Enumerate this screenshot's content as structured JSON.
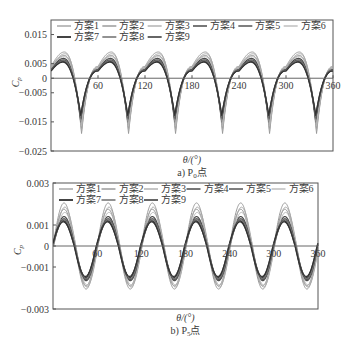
{
  "figure": {
    "background": "#ffffff",
    "axis_color": "#555555",
    "zero_line_color": "#666666"
  },
  "chart_data": [
    {
      "id": "P0",
      "type": "line",
      "title": "",
      "caption": "a) P₀点",
      "caption_prefix": "a) P",
      "caption_sub": "0",
      "caption_suffix": "点",
      "xlabel": "θ/(°)",
      "ylabel": "Cp",
      "ylabel_main": "C",
      "ylabel_sub": "p",
      "xlim": [
        0,
        360
      ],
      "ylim": [
        -0.025,
        0.02
      ],
      "xticks": [
        60,
        120,
        180,
        240,
        300,
        360
      ],
      "xtick_labels": [
        "60",
        "120",
        "180",
        "240",
        "300",
        "360"
      ],
      "yticks": [
        0.015,
        0.005,
        0,
        -0.005,
        -0.015,
        -0.025
      ],
      "ytick_labels": [
        "0.015",
        "0.005",
        "0",
        "-0.005",
        "-0.015",
        "-0.025"
      ],
      "grid": false,
      "zero_line": true,
      "legend_position": "top-inside",
      "frame": {
        "left": 51,
        "top": 20,
        "right": 333,
        "bottom": 151
      },
      "period_deg": 60,
      "waveform": "cusp",
      "phase_deg": 0,
      "series": [
        {
          "name": "方案1",
          "color": "#9a9a9a",
          "width": 1.0,
          "peak": 0.009,
          "trough": -0.019,
          "peak_at": 17,
          "trough_at": 39
        },
        {
          "name": "方案2",
          "color": "#8c8c8c",
          "width": 1.0,
          "peak": 0.0078,
          "trough": -0.0172,
          "peak_at": 17,
          "trough_at": 39
        },
        {
          "name": "方案3",
          "color": "#a8a8a8",
          "width": 1.0,
          "peak": 0.0084,
          "trough": -0.0182,
          "peak_at": 18,
          "trough_at": 39
        },
        {
          "name": "方案4",
          "color": "#4a4a4a",
          "width": 1.2,
          "peak": 0.0068,
          "trough": -0.015,
          "peak_at": 16,
          "trough_at": 38
        },
        {
          "name": "方案5",
          "color": "#555555",
          "width": 1.2,
          "peak": 0.0063,
          "trough": -0.014,
          "peak_at": 16,
          "trough_at": 38
        },
        {
          "name": "方案6",
          "color": "#b5b5b5",
          "width": 1.0,
          "peak": 0.0074,
          "trough": -0.0165,
          "peak_at": 17,
          "trough_at": 39
        },
        {
          "name": "方案7",
          "color": "#3a3a3a",
          "width": 1.6,
          "peak": 0.0058,
          "trough": -0.0132,
          "peak_at": 15,
          "trough_at": 38
        },
        {
          "name": "方案8",
          "color": "#6e6e6e",
          "width": 1.2,
          "peak": 0.006,
          "trough": -0.0138,
          "peak_at": 16,
          "trough_at": 38
        },
        {
          "name": "方案9",
          "color": "#333333",
          "width": 1.2,
          "peak": 0.0055,
          "trough": -0.0128,
          "peak_at": 15,
          "trough_at": 38
        }
      ]
    },
    {
      "id": "P5",
      "type": "line",
      "title": "",
      "caption": "b) P₅点",
      "caption_prefix": "b) P",
      "caption_sub": "5",
      "caption_suffix": "点",
      "xlabel": "θ/(°)",
      "ylabel": "Cp",
      "ylabel_main": "C",
      "ylabel_sub": "p",
      "xlim": [
        0,
        360
      ],
      "ylim": [
        -0.003,
        0.003
      ],
      "xticks": [
        60,
        120,
        180,
        240,
        300,
        360
      ],
      "xtick_labels": [
        "60",
        "120",
        "180",
        "240",
        "300",
        "360"
      ],
      "yticks": [
        0.003,
        0.001,
        0,
        -0.001,
        -0.003
      ],
      "ytick_labels": [
        "0.003",
        "0.001",
        "0",
        "-0.001",
        "-0.003"
      ],
      "grid": false,
      "zero_line": true,
      "legend_position": "top-inside",
      "frame": {
        "left": 53,
        "top": 183,
        "right": 318,
        "bottom": 309
      },
      "period_deg": 60,
      "waveform": "smooth",
      "phase_deg": 0,
      "series": [
        {
          "name": "方案1",
          "color": "#9a9a9a",
          "width": 1.0,
          "peak": 0.00205,
          "trough": -0.00205,
          "peak_at": 15,
          "trough_at": 45
        },
        {
          "name": "方案2",
          "color": "#8c8c8c",
          "width": 1.0,
          "peak": 0.00175,
          "trough": -0.0019,
          "peak_at": 15,
          "trough_at": 45
        },
        {
          "name": "方案3",
          "color": "#a8a8a8",
          "width": 1.0,
          "peak": 0.00185,
          "trough": -0.00195,
          "peak_at": 16,
          "trough_at": 46
        },
        {
          "name": "方案4",
          "color": "#4a4a4a",
          "width": 1.2,
          "peak": 0.0014,
          "trough": -0.00165,
          "peak_at": 15,
          "trough_at": 45
        },
        {
          "name": "方案5",
          "color": "#555555",
          "width": 1.2,
          "peak": 0.0013,
          "trough": -0.0016,
          "peak_at": 15,
          "trough_at": 45
        },
        {
          "name": "方案6",
          "color": "#b5b5b5",
          "width": 1.0,
          "peak": 0.0016,
          "trough": -0.00185,
          "peak_at": 16,
          "trough_at": 46
        },
        {
          "name": "方案7",
          "color": "#3a3a3a",
          "width": 1.6,
          "peak": 0.0012,
          "trough": -0.0015,
          "peak_at": 14,
          "trough_at": 44
        },
        {
          "name": "方案8",
          "color": "#6e6e6e",
          "width": 1.2,
          "peak": 0.00125,
          "trough": -0.00155,
          "peak_at": 15,
          "trough_at": 45
        },
        {
          "name": "方案9",
          "color": "#333333",
          "width": 1.2,
          "peak": 0.00115,
          "trough": -0.00145,
          "peak_at": 14,
          "trough_at": 44
        }
      ]
    }
  ]
}
